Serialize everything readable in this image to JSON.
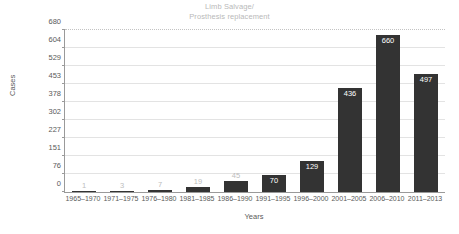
{
  "chart_data": {
    "type": "bar",
    "title": "Limb Salvage/",
    "subtitle": "Prosthesis replacement",
    "xlabel": "Years",
    "ylabel": "Cases",
    "categories": [
      "1965–1970",
      "1971–1975",
      "1976–1980",
      "1981–1985",
      "1986–1990",
      "1991–1995",
      "1996–2000",
      "2001–2005",
      "2006–2010",
      "2011–2013"
    ],
    "values": [
      1,
      3,
      7,
      19,
      45,
      70,
      129,
      436,
      660,
      497
    ],
    "ylim": [
      0,
      680
    ],
    "yticks": [
      0,
      76,
      151,
      227,
      302,
      378,
      453,
      529,
      604,
      680
    ],
    "ytick_labels": [
      "0",
      "76",
      "151",
      "227",
      "302",
      "378",
      "453",
      "529",
      "604",
      "680"
    ],
    "grid": true,
    "legend": "none",
    "bar_color": "#333333",
    "value_label_inside_color": "#ffffff",
    "value_label_outside_color": "#bdbdbd",
    "axis_color": "#9a9a9a",
    "grid_color": "#e3e3e3",
    "tick_text_color": "#5a5a5a",
    "title_color": "#b9b9b9",
    "background_color": "#ffffff"
  }
}
